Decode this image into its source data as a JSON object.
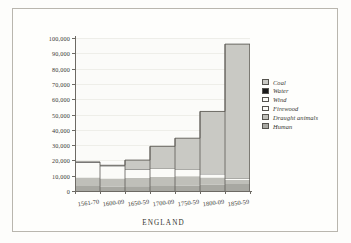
{
  "caption": "ENGLAND",
  "legend": {
    "position": "right",
    "items": [
      {
        "label": "Coal",
        "color": "#c9c9c4",
        "swatch": "legend-swatch-coal"
      },
      {
        "label": "Water",
        "color": "#1b1b1b",
        "swatch": "legend-swatch-water"
      },
      {
        "label": "Wind",
        "color": "#fbfbf8",
        "swatch": "legend-swatch-wind"
      },
      {
        "label": "Firewood",
        "color": "#fbfbf8",
        "swatch": "legend-swatch-firewood"
      },
      {
        "label": "Draught animals",
        "color": "#bfbfb9",
        "swatch": "legend-swatch-draught-animals"
      },
      {
        "label": "Human",
        "color": "#a8a8a2",
        "swatch": "legend-swatch-human"
      }
    ]
  },
  "chart_data": {
    "type": "area",
    "title": "",
    "subtitle": "",
    "xlabel": "ENGLAND",
    "ylabel": "",
    "grid": true,
    "ylim": [
      0,
      100000
    ],
    "ytick_values": [
      0,
      10000,
      20000,
      30000,
      40000,
      50000,
      60000,
      70000,
      80000,
      90000,
      100000
    ],
    "ytick_labels": [
      "0",
      "10,000",
      "20,000",
      "30,000",
      "40,000",
      "50,000",
      "60,000",
      "70,000",
      "80,000",
      "90,000",
      "100,000"
    ],
    "categories": [
      "1561-70",
      "1600-09",
      "1650-59",
      "1700-09",
      "1750-59",
      "1800-09",
      "1850-59"
    ],
    "stacked": true,
    "totals": [
      19000,
      16800,
      20200,
      29200,
      34500,
      52000,
      96000
    ],
    "series": [
      {
        "name": "Human",
        "values": [
          3300,
          3000,
          3100,
          3300,
          3500,
          4200,
          4600
        ]
      },
      {
        "name": "Draught animals",
        "values": [
          5600,
          5200,
          5400,
          5800,
          6100,
          4700,
          2600
        ]
      },
      {
        "name": "Firewood",
        "values": [
          9100,
          7200,
          4500,
          4200,
          3000,
          1100,
          300
        ]
      },
      {
        "name": "Wind",
        "values": [
          700,
          800,
          900,
          1000,
          1100,
          900,
          400
        ]
      },
      {
        "name": "Water",
        "values": [
          300,
          300,
          300,
          400,
          400,
          400,
          300
        ]
      },
      {
        "name": "Coal",
        "values": [
          0,
          300,
          6000,
          14500,
          20400,
          40700,
          87800
        ]
      }
    ]
  }
}
